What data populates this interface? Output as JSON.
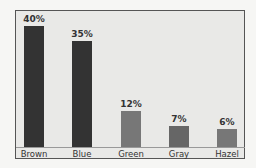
{
  "chart_data": {
    "type": "bar",
    "title": "",
    "xlabel": "",
    "ylabel": "",
    "categories": [
      "Brown",
      "Blue",
      "Green",
      "Gray",
      "Hazel"
    ],
    "values": [
      40,
      35,
      12,
      7,
      6
    ],
    "value_labels": [
      "40%",
      "35%",
      "12%",
      "7%",
      "6%"
    ],
    "unit": "%",
    "ylim": [
      0,
      40
    ],
    "grid": false,
    "legend": "none",
    "colors": [
      "#333333",
      "#333333",
      "#777777",
      "#666666",
      "#777777"
    ]
  },
  "layout": {
    "baseline_y": 147,
    "px_per_unit": 3.03,
    "bar_x": [
      24,
      72,
      121,
      169,
      217
    ]
  }
}
